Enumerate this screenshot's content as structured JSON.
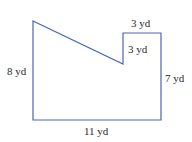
{
  "diagram": {
    "type": "composite-polygon",
    "stroke_color": "#4a64b4",
    "background": "#ffffff",
    "labels": {
      "left": "8 yd",
      "bottom": "11 yd",
      "right": "7 yd",
      "notch_top": "3 yd",
      "notch_side": "3 yd"
    }
  }
}
